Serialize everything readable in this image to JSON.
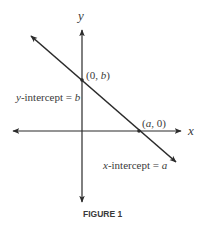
{
  "diagram": {
    "axes": {
      "x_label": "x",
      "y_label": "y"
    },
    "line": {
      "description": "line with negative slope crossing both axes"
    },
    "points": {
      "y_intercept_point": {
        "open": "(0, ",
        "var": "b",
        "close": ")"
      },
      "x_intercept_point": {
        "open": "(",
        "var": "a",
        "close": ", 0)"
      }
    },
    "labels": {
      "y_intercept": {
        "var": "y",
        "text": "-intercept = ",
        "value": "b"
      },
      "x_intercept": {
        "var": "x",
        "text": "-intercept = ",
        "value": "a"
      }
    },
    "caption": "FIGURE 1",
    "colors": {
      "stroke": "#2b2b2b",
      "text": "#3a3a3a",
      "background": "#ffffff"
    }
  }
}
